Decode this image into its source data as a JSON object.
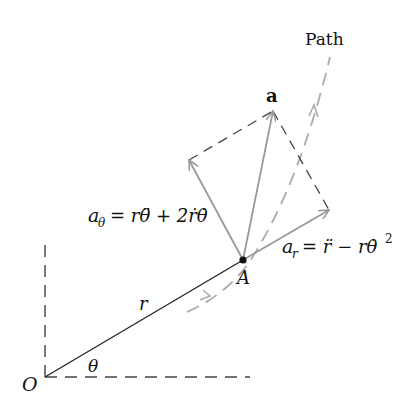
{
  "diagram": {
    "labels": {
      "path": "Path",
      "acceleration": "a",
      "point": "A",
      "origin": "O",
      "radius": "r",
      "angle": "θ",
      "a_theta_lhs": "a",
      "a_theta_sub": "θ",
      "a_theta_rhs": "= rθ̈ + 2ṙθ̇",
      "a_r_lhs": "a",
      "a_r_sub": "r",
      "a_r_rhs": "= r̈ − rθ̇",
      "a_r_sup": "2"
    },
    "colors": {
      "vector": "#999999",
      "dashed": "#444444",
      "path": "#aaaaaa",
      "radius": "#222222",
      "text": "#111111"
    },
    "points": {
      "O": [
        45,
        377
      ],
      "A": [
        243,
        260
      ],
      "a_tip": [
        273,
        111
      ],
      "ar_tip": [
        329,
        210
      ],
      "atheta_tip": [
        189,
        160
      ]
    }
  }
}
